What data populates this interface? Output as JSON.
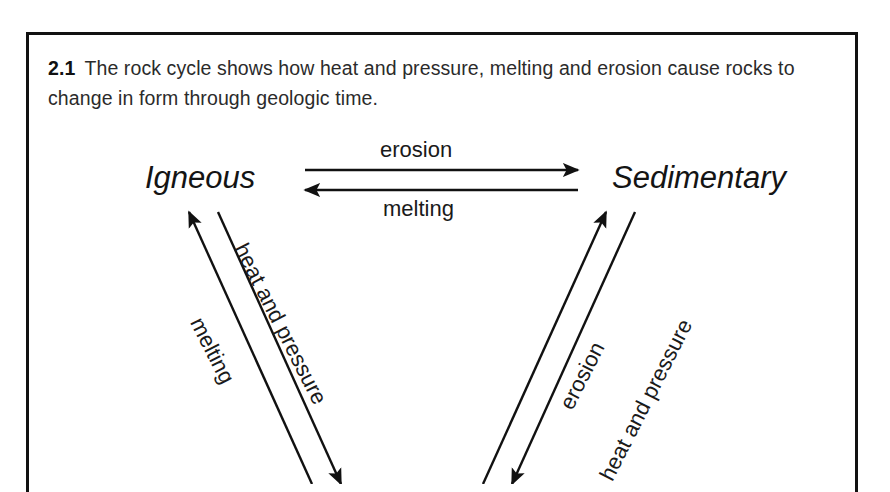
{
  "figure": {
    "caption_number": "2.1",
    "caption_text": "The rock cycle shows how heat and pressure, melting and erosion cause rocks to change in form through geologic time.",
    "frame_color": "#111111",
    "background_color": "#ffffff",
    "ink_color": "#1a1a1a"
  },
  "diagram": {
    "nodes": [
      {
        "id": "igneous",
        "label": "Igneous"
      },
      {
        "id": "sedimentary",
        "label": "Sedimentary"
      }
    ],
    "edges": [
      {
        "id": "erosion-top",
        "label": "erosion",
        "from": "igneous",
        "to": "sedimentary",
        "direction": "right"
      },
      {
        "id": "melting-top",
        "label": "melting",
        "from": "sedimentary",
        "to": "igneous",
        "direction": "left"
      },
      {
        "id": "melting-left",
        "label": "melting",
        "from": "metamorphic",
        "to": "igneous",
        "direction": "up-left"
      },
      {
        "id": "heat-pressure-left",
        "label": "heat and pressure",
        "from": "igneous",
        "to": "metamorphic",
        "direction": "down-right"
      },
      {
        "id": "erosion-right",
        "label": "erosion",
        "from": "metamorphic",
        "to": "sedimentary",
        "direction": "up-right"
      },
      {
        "id": "heat-pressure-right",
        "label": "heat and pressure",
        "from": "sedimentary",
        "to": "metamorphic",
        "direction": "down-left"
      }
    ]
  }
}
